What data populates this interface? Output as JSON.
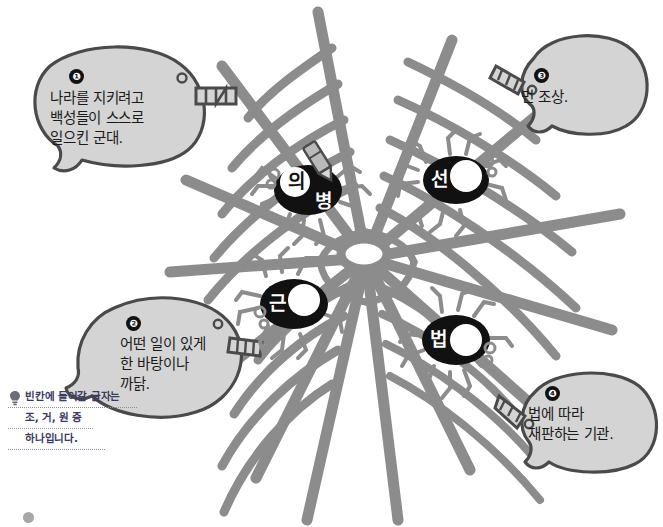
{
  "page": {
    "background_color": "#ffffff",
    "web_color": "#8c8c8c",
    "bubble_fill": "#d4d4d4",
    "bubble_stroke": "#4a4a4a",
    "spider_body_color": "#111111",
    "spider_leg_color": "#8c8c8c"
  },
  "clues": [
    {
      "number": "❶",
      "number_value": "1",
      "text": "나라를 지키려고\n백성들이 스스로\n일으킨 군대.",
      "target": "의병"
    },
    {
      "number": "❷",
      "number_value": "2",
      "text": "어떤 일이 있게\n한 바탕이나\n까닭.",
      "target": "근"
    },
    {
      "number": "❸",
      "number_value": "3",
      "text": "먼 조상.",
      "target": "선"
    },
    {
      "number": "❹",
      "number_value": "4",
      "text": "법에 따라\n재판하는 기관.",
      "target": "법"
    }
  ],
  "spiders": [
    {
      "id": "spider-uibyeong",
      "filled": "의",
      "syllable": "병",
      "blank": false,
      "blank_value": ""
    },
    {
      "id": "spider-seon",
      "filled": "",
      "syllable": "선",
      "blank": true,
      "blank_value": ""
    },
    {
      "id": "spider-geun",
      "filled": "",
      "syllable": "근",
      "blank": true,
      "blank_value": ""
    },
    {
      "id": "spider-beop",
      "filled": "",
      "syllable": "법",
      "blank": true,
      "blank_value": ""
    }
  ],
  "note": {
    "icon": "lightbulb-icon",
    "line1": "빈칸에 들어갈 글자는",
    "line2": "조, 거, 원 중",
    "line3": "하나입니다."
  }
}
